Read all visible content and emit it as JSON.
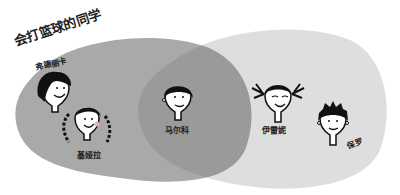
{
  "diagram": {
    "type": "venn",
    "sets": [
      {
        "id": "basketball",
        "label": "会打篮球的同学",
        "color": "#a9a9a9"
      },
      {
        "id": "other",
        "label": "",
        "color": "#dedede"
      }
    ],
    "overlap_color": "#9a9a9a",
    "members": [
      {
        "name": "弗德丽卡",
        "set": "basketball",
        "face": "girl-bob"
      },
      {
        "name": "基娅拉",
        "set": "basketball",
        "face": "girl-braids"
      },
      {
        "name": "马尔科",
        "set": "both",
        "face": "boy-short"
      },
      {
        "name": "伊雷妮",
        "set": "other",
        "face": "girl-pigtails"
      },
      {
        "name": "保罗",
        "set": "other",
        "face": "boy-spiky"
      }
    ]
  }
}
